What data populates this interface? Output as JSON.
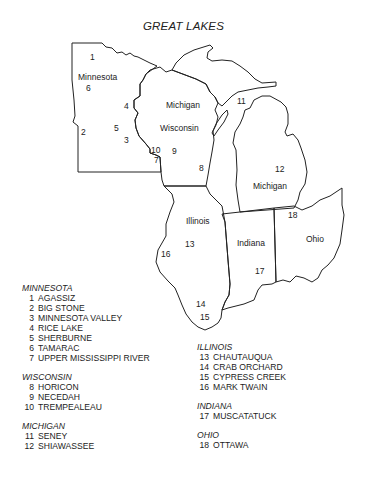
{
  "title": "GREAT LAKES",
  "map": {
    "states": [
      {
        "name": "Minnesota",
        "x": 78,
        "y": 80
      },
      {
        "name": "Wisconsin",
        "x": 160,
        "y": 131
      },
      {
        "name": "Michigan",
        "x": 166,
        "y": 108
      },
      {
        "name": "Michigan",
        "x": 253,
        "y": 189
      },
      {
        "name": "Illinois",
        "x": 186,
        "y": 224
      },
      {
        "name": "Indiana",
        "x": 237,
        "y": 246
      },
      {
        "name": "Ohio",
        "x": 306,
        "y": 242
      }
    ],
    "markers": [
      {
        "n": "1",
        "x": 90,
        "y": 60
      },
      {
        "n": "2",
        "x": 81,
        "y": 135
      },
      {
        "n": "3",
        "x": 124,
        "y": 143
      },
      {
        "n": "4",
        "x": 124,
        "y": 109
      },
      {
        "n": "5",
        "x": 114,
        "y": 131
      },
      {
        "n": "6",
        "x": 86,
        "y": 91
      },
      {
        "n": "7",
        "x": 154,
        "y": 163
      },
      {
        "n": "8",
        "x": 199,
        "y": 171
      },
      {
        "n": "9",
        "x": 172,
        "y": 154
      },
      {
        "n": "10",
        "x": 151,
        "y": 153
      },
      {
        "n": "11",
        "x": 237,
        "y": 104
      },
      {
        "n": "12",
        "x": 275,
        "y": 172
      },
      {
        "n": "13",
        "x": 185,
        "y": 247
      },
      {
        "n": "14",
        "x": 196,
        "y": 307
      },
      {
        "n": "15",
        "x": 200,
        "y": 320
      },
      {
        "n": "16",
        "x": 161,
        "y": 257
      },
      {
        "n": "17",
        "x": 255,
        "y": 274
      },
      {
        "n": "18",
        "x": 288,
        "y": 218
      }
    ]
  },
  "legend": [
    {
      "state": "MINNESOTA",
      "items": [
        {
          "n": "1",
          "name": "AGASSIZ"
        },
        {
          "n": "2",
          "name": "BIG STONE"
        },
        {
          "n": "3",
          "name": "MINNESOTA VALLEY"
        },
        {
          "n": "4",
          "name": "RICE LAKE"
        },
        {
          "n": "5",
          "name": "SHERBURNE"
        },
        {
          "n": "6",
          "name": "TAMARAC"
        },
        {
          "n": "7",
          "name": "UPPER MISSISSIPPI RIVER"
        }
      ]
    },
    {
      "state": "WISCONSIN",
      "items": [
        {
          "n": "8",
          "name": "HORICON"
        },
        {
          "n": "9",
          "name": "NECEDAH"
        },
        {
          "n": "10",
          "name": "TREMPEALEAU"
        }
      ]
    },
    {
      "state": "MICHIGAN",
      "items": [
        {
          "n": "11",
          "name": "SENEY"
        },
        {
          "n": "12",
          "name": "SHIAWASSEE"
        }
      ]
    },
    {
      "state": "ILLINOIS",
      "items": [
        {
          "n": "13",
          "name": "CHAUTAUQUA"
        },
        {
          "n": "14",
          "name": "CRAB ORCHARD"
        },
        {
          "n": "15",
          "name": "CYPRESS CREEK"
        },
        {
          "n": "16",
          "name": "MARK TWAIN"
        }
      ]
    },
    {
      "state": "INDIANA",
      "items": [
        {
          "n": "17",
          "name": "MUSCATATUCK"
        }
      ]
    },
    {
      "state": "OHIO",
      "items": [
        {
          "n": "18",
          "name": "OTTAWA"
        }
      ]
    }
  ]
}
